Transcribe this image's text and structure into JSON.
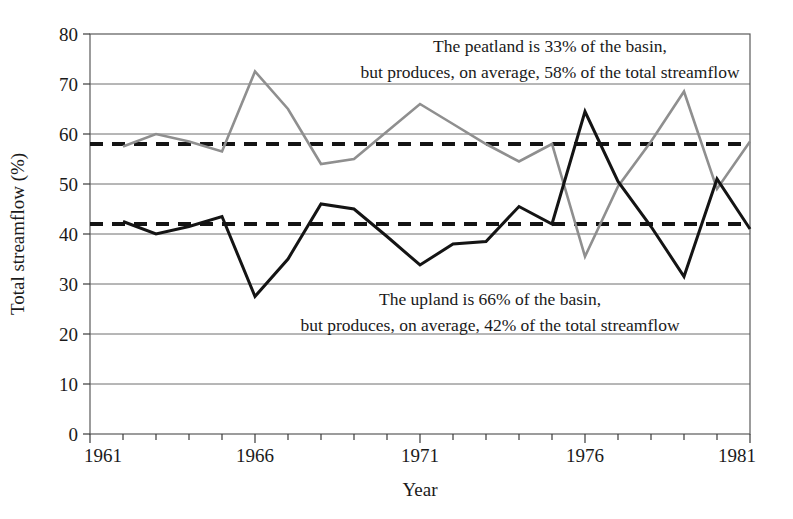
{
  "chart_data": {
    "type": "line",
    "title": "",
    "xlabel": "Year",
    "ylabel": "Total streamflow (%)",
    "xlim": [
      1961,
      1981
    ],
    "ylim": [
      0,
      80
    ],
    "ytick_step": 10,
    "yticks": [
      0,
      10,
      20,
      30,
      40,
      50,
      60,
      70,
      80
    ],
    "xticks_labeled": [
      1961,
      1966,
      1971,
      1976,
      1981
    ],
    "xticks_all": [
      1961,
      1962,
      1963,
      1964,
      1965,
      1966,
      1967,
      1968,
      1969,
      1970,
      1971,
      1972,
      1973,
      1974,
      1975,
      1976,
      1977,
      1978,
      1979,
      1980,
      1981
    ],
    "grid": "horizontal",
    "legend": "none",
    "x": [
      1962,
      1963,
      1964,
      1965,
      1966,
      1967,
      1968,
      1969,
      1970,
      1971,
      1972,
      1973,
      1974,
      1975,
      1976,
      1977,
      1978,
      1979,
      1980,
      1981
    ],
    "series": [
      {
        "name": "Peatland streamflow",
        "color": "#8f8f8f",
        "width": 2.6,
        "values": [
          57.5,
          60.0,
          58.5,
          56.5,
          72.5,
          65.0,
          54.0,
          55.0,
          60.5,
          66.0,
          62.0,
          58.0,
          54.5,
          58.0,
          35.5,
          49.5,
          58.5,
          68.5,
          49.0,
          58.5
        ]
      },
      {
        "name": "Upland streamflow",
        "color": "#141414",
        "width": 3.0,
        "values": [
          42.5,
          40.0,
          41.5,
          43.5,
          27.5,
          35.0,
          46.0,
          45.0,
          39.5,
          33.8,
          38.0,
          38.5,
          45.5,
          42.0,
          64.5,
          50.5,
          41.5,
          31.5,
          51.0,
          41.0
        ]
      }
    ],
    "reference_lines": [
      {
        "name": "peatland-mean",
        "value": 58,
        "style": "dashed",
        "color": "#141414",
        "width": 4
      },
      {
        "name": "upland-mean",
        "value": 42,
        "style": "dashed",
        "color": "#141414",
        "width": 4
      }
    ],
    "annotations": [
      {
        "name": "peatland-annotation",
        "lines": [
          "The peatland is 33% of the basin,",
          "but produces, on average, 58% of the total streamflow"
        ]
      },
      {
        "name": "upland-annotation",
        "lines": [
          "The upland is 66% of the basin,",
          "but produces, on average, 42% of the total streamflow"
        ]
      }
    ]
  },
  "axis": {
    "y_title": "Total streamflow (%)",
    "x_title": "Year",
    "y_tick_labels": [
      "80",
      "70",
      "60",
      "50",
      "40",
      "30",
      "20",
      "10",
      "0"
    ],
    "x_tick_labels": [
      "1961",
      "1966",
      "1971",
      "1976",
      "1981"
    ]
  },
  "annotations": {
    "peatland_line1": "The peatland is 33% of the basin,",
    "peatland_line2": "but produces, on average, 58% of the total streamflow",
    "upland_line1": "The upland is 66% of the basin,",
    "upland_line2": "but produces, on average, 42% of the total streamflow"
  },
  "colors": {
    "peatland_series": "#8f8f8f",
    "upland_series": "#141414",
    "gridline": "#6e6e6e",
    "frame": "#5a5a5a",
    "text": "#1a1a1a",
    "background": "#ffffff"
  }
}
